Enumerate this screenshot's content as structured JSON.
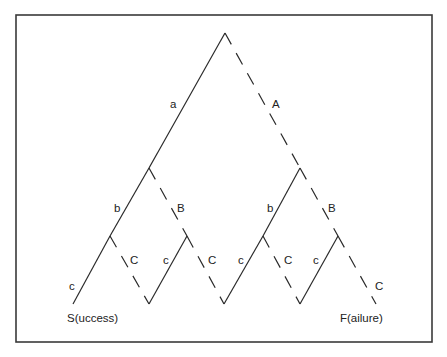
{
  "diagram": {
    "type": "probability-tree",
    "frame": {
      "x": 16,
      "y": 15,
      "width": 416,
      "height": 327
    },
    "legend_style": {
      "success_branch": "solid",
      "failure_branch": "dashed"
    },
    "nodes": {
      "root": {
        "x": 225,
        "y": 33
      },
      "n_a": {
        "x": 149,
        "y": 168
      },
      "n_A": {
        "x": 300,
        "y": 168
      },
      "n_ab": {
        "x": 110,
        "y": 236
      },
      "n_aB": {
        "x": 187,
        "y": 236
      },
      "n_Ab": {
        "x": 263,
        "y": 236
      },
      "n_AB": {
        "x": 338,
        "y": 236
      },
      "leaf_success": {
        "x": 73,
        "y": 304
      },
      "v1": {
        "x": 149,
        "y": 304
      },
      "v2": {
        "x": 224,
        "y": 304
      },
      "v3": {
        "x": 300,
        "y": 304
      },
      "leaf_failure": {
        "x": 376,
        "y": 304
      }
    },
    "edges": [
      {
        "from": "root",
        "to": "n_a",
        "style": "solid",
        "label": "a"
      },
      {
        "from": "root",
        "to": "n_A",
        "style": "dashed",
        "label": "A"
      },
      {
        "from": "n_a",
        "to": "n_ab",
        "style": "solid",
        "label": "b"
      },
      {
        "from": "n_a",
        "to": "n_aB",
        "style": "dashed",
        "label": "B"
      },
      {
        "from": "n_ab",
        "to": "leaf_success",
        "style": "solid",
        "label": "c"
      },
      {
        "from": "n_ab",
        "to": "v1",
        "style": "dashed",
        "label": "C"
      },
      {
        "from": "v1",
        "to": "n_aB",
        "style": "solid",
        "label": "c"
      },
      {
        "from": "n_aB",
        "to": "v2",
        "style": "dashed",
        "label": "C"
      },
      {
        "from": "n_A",
        "to": "n_Ab",
        "style": "solid",
        "label": "b"
      },
      {
        "from": "n_A",
        "to": "n_AB",
        "style": "dashed",
        "label": "B"
      },
      {
        "from": "v2",
        "to": "n_Ab",
        "style": "solid",
        "label": "c"
      },
      {
        "from": "n_Ab",
        "to": "v3",
        "style": "dashed",
        "label": "C"
      },
      {
        "from": "v3",
        "to": "n_AB",
        "style": "solid",
        "label": "c"
      },
      {
        "from": "n_AB",
        "to": "leaf_failure",
        "style": "dashed",
        "label": "C"
      }
    ],
    "labels": {
      "a": "a",
      "A": "A",
      "b_left": "b",
      "B_left": "B",
      "b_right": "b",
      "B_right": "B",
      "c1": "c",
      "C1": "C",
      "c2": "c",
      "C2": "C",
      "c3": "c",
      "C3": "C",
      "c4": "c",
      "C4": "C"
    },
    "endpoints": {
      "success": "S(uccess)",
      "failure": "F(ailure)"
    }
  }
}
